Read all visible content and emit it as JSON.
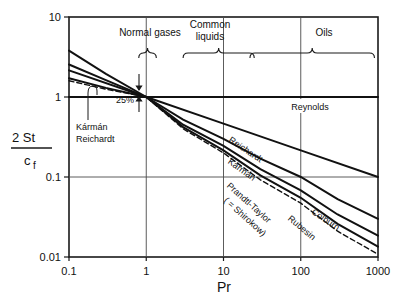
{
  "chart_data": {
    "type": "line",
    "title": "",
    "xlabel": "Pr",
    "ylabel": "2 St / c_f",
    "ylabel_numerator": "2 St",
    "ylabel_denominator": "c",
    "ylabel_denominator_sub": "f",
    "xscale": "log",
    "yscale": "log",
    "xlim": [
      0.1,
      1000
    ],
    "ylim": [
      0.01,
      10
    ],
    "grid": true,
    "xticks": [
      "0.1",
      "1",
      "10",
      "100",
      "1000"
    ],
    "xtick_values": [
      0.1,
      1,
      10,
      100,
      1000
    ],
    "yticks": [
      "10",
      "1",
      "0.1",
      "0.01"
    ],
    "ytick_values": [
      10,
      1,
      0.1,
      0.01
    ],
    "legend_position": "inline-curve-labels",
    "series": [
      {
        "name": "Reynolds",
        "label": "Reynolds",
        "style": "solid",
        "label_x": 310,
        "label_y": 110,
        "label_rotation": 0,
        "points": [
          [
            0.1,
            1.0
          ],
          [
            1,
            1.0
          ],
          [
            10,
            1.0
          ],
          [
            100,
            1.0
          ],
          [
            1000,
            1.0
          ]
        ]
      },
      {
        "name": "Colburn",
        "label": "Colburn",
        "style": "solid",
        "label_x": 324,
        "label_y": 222,
        "label_rotation": 34,
        "points": [
          [
            0.1,
            2.15
          ],
          [
            1,
            1.0
          ],
          [
            10,
            0.465
          ],
          [
            100,
            0.215
          ],
          [
            1000,
            0.1
          ]
        ]
      },
      {
        "name": "Reichardt",
        "label": "Reichardt",
        "style": "solid",
        "label_x": 244,
        "label_y": 152,
        "label_rotation": 34,
        "points": [
          [
            0.1,
            3.8
          ],
          [
            0.3,
            1.95
          ],
          [
            1,
            1.0
          ],
          [
            3,
            0.52
          ],
          [
            10,
            0.3
          ],
          [
            30,
            0.17
          ],
          [
            100,
            0.1
          ],
          [
            300,
            0.053
          ],
          [
            1000,
            0.03
          ]
        ]
      },
      {
        "name": "Karman",
        "label": "Kármán",
        "style": "solid",
        "label_x": 240,
        "label_y": 172,
        "label_rotation": 36,
        "points": [
          [
            0.1,
            2.55
          ],
          [
            0.3,
            1.62
          ],
          [
            1,
            1.0
          ],
          [
            3,
            0.45
          ],
          [
            10,
            0.245
          ],
          [
            30,
            0.125
          ],
          [
            100,
            0.068
          ],
          [
            300,
            0.034
          ],
          [
            1000,
            0.0185
          ]
        ]
      },
      {
        "name": "Rubesin",
        "label": "Rubesin",
        "style": "solid",
        "label_x": 300,
        "label_y": 230,
        "label_rotation": 40,
        "points": [
          [
            0.1,
            1.72
          ],
          [
            0.3,
            1.3
          ],
          [
            1,
            1.0
          ],
          [
            3,
            0.42
          ],
          [
            10,
            0.215
          ],
          [
            30,
            0.105
          ],
          [
            100,
            0.055
          ],
          [
            300,
            0.026
          ],
          [
            1000,
            0.0135
          ]
        ]
      },
      {
        "name": "Prandtl-Taylor (= Shirokow)",
        "label": "Prandtl-Taylor",
        "label2": "( = Shirokow)",
        "style": "dashed",
        "label_x": 247,
        "label_y": 205,
        "label2_x": 243,
        "label2_y": 219,
        "label_rotation": 42,
        "points": [
          [
            0.1,
            1.6
          ],
          [
            0.3,
            1.25
          ],
          [
            1,
            1.0
          ],
          [
            3,
            0.4
          ],
          [
            10,
            0.2
          ],
          [
            30,
            0.092
          ],
          [
            100,
            0.047
          ],
          [
            300,
            0.021
          ],
          [
            1000,
            0.0108
          ]
        ]
      }
    ],
    "annotations": [
      {
        "name": "normal-gases-bracket",
        "label": "Normal gases",
        "x_from": 0.8,
        "x_to": 1.35,
        "text_x": 150,
        "text_y": 36
      },
      {
        "name": "common-liquids-bracket",
        "label_line1": "Common",
        "label_line2": "liquids",
        "x_from": 3.0,
        "x_to": 25,
        "text_x": 210,
        "text_y": 28
      },
      {
        "name": "oils-bracket",
        "label": "Oils",
        "x_from": 22,
        "x_to": 900,
        "text_x": 324,
        "text_y": 36
      },
      {
        "name": "percent-gap-annotation",
        "label": "25%",
        "text_x": 125,
        "text_y": 103
      },
      {
        "name": "karman-reichardt-callout",
        "label_line1": "Kármán",
        "label_line2": "Reichardt",
        "text_x": 76,
        "text_y": 130,
        "leader_x": 85,
        "leader_y": 87
      }
    ]
  }
}
